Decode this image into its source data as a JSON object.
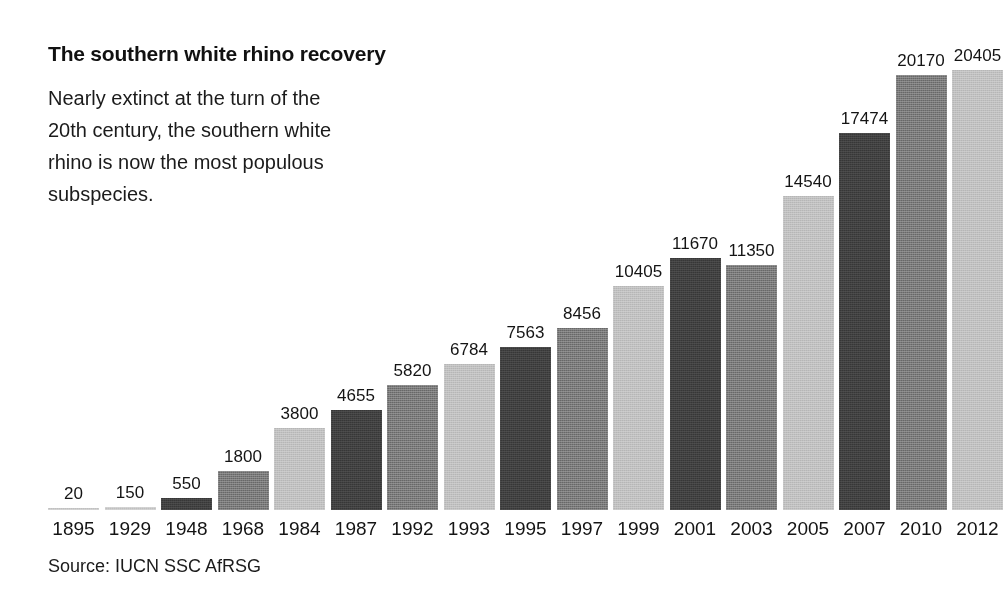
{
  "headline": "The southern white rhino recovery",
  "standfirst": "Nearly extinct at the turn of the 20th century, the southern white rhino is now the most populous subspecies.",
  "source": "Source: IUCN SSC AfRSG",
  "colors": {
    "dark": "#3f3f3f",
    "mid": "#787878",
    "light": "#bfbfbf",
    "text": "#141414",
    "background": "#ffffff"
  },
  "chart_data": {
    "type": "bar",
    "title": "The southern white rhino recovery",
    "subtitle": "Nearly extinct at the turn of the 20th century, the southern white rhino is now the most populous subspecies.",
    "xlabel": "",
    "ylabel": "",
    "ylim": [
      0,
      20405
    ],
    "grid": false,
    "legend": "none",
    "source": "Source: IUCN SSC AfRSG",
    "categories": [
      "1895",
      "1929",
      "1948",
      "1968",
      "1984",
      "1987",
      "1992",
      "1993",
      "1995",
      "1997",
      "1999",
      "2001",
      "2003",
      "2005",
      "2007",
      "2010",
      "2012"
    ],
    "values": [
      20,
      150,
      550,
      1800,
      3800,
      4655,
      5820,
      6784,
      7563,
      8456,
      10405,
      11670,
      11350,
      14540,
      17474,
      20170,
      20405
    ],
    "bar_tones": [
      "light",
      "light",
      "dark",
      "mid",
      "light",
      "dark",
      "mid",
      "light",
      "dark",
      "mid",
      "light",
      "dark",
      "mid",
      "light",
      "dark",
      "mid",
      "light"
    ],
    "bars": [
      {
        "year": "1895",
        "value": 20,
        "label": "20",
        "tone": "light"
      },
      {
        "year": "1929",
        "value": 150,
        "label": "150",
        "tone": "light"
      },
      {
        "year": "1948",
        "value": 550,
        "label": "550",
        "tone": "dark"
      },
      {
        "year": "1968",
        "value": 1800,
        "label": "1800",
        "tone": "mid"
      },
      {
        "year": "1984",
        "value": 3800,
        "label": "3800",
        "tone": "light"
      },
      {
        "year": "1987",
        "value": 4655,
        "label": "4655",
        "tone": "dark"
      },
      {
        "year": "1992",
        "value": 5820,
        "label": "5820",
        "tone": "mid"
      },
      {
        "year": "1993",
        "value": 6784,
        "label": "6784",
        "tone": "light"
      },
      {
        "year": "1995",
        "value": 7563,
        "label": "7563",
        "tone": "dark"
      },
      {
        "year": "1997",
        "value": 8456,
        "label": "8456",
        "tone": "mid"
      },
      {
        "year": "1999",
        "value": 10405,
        "label": "10405",
        "tone": "light"
      },
      {
        "year": "2001",
        "value": 11670,
        "label": "11670",
        "tone": "dark"
      },
      {
        "year": "2003",
        "value": 11350,
        "label": "11350",
        "tone": "mid"
      },
      {
        "year": "2005",
        "value": 14540,
        "label": "14540",
        "tone": "light"
      },
      {
        "year": "2007",
        "value": 17474,
        "label": "17474",
        "tone": "dark"
      },
      {
        "year": "2010",
        "value": 20170,
        "label": "20170",
        "tone": "mid"
      },
      {
        "year": "2012",
        "value": 20405,
        "label": "20405",
        "tone": "light"
      }
    ]
  },
  "layout": {
    "plot_left": 48,
    "bar_width": 51,
    "bar_pitch": 56.5,
    "baseline_y": 510,
    "max_bar_px": 440
  }
}
